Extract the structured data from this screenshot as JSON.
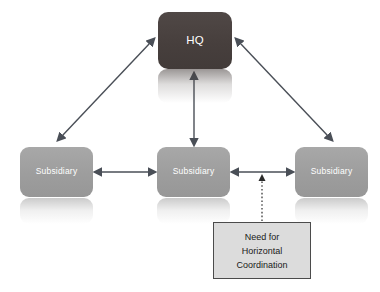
{
  "diagram": {
    "colors": {
      "hq_fill": "#473f3d",
      "subsidiary_fill": "#9d9d9d",
      "arrow": "#4a4f57",
      "callout_fill": "#dcdcdc",
      "callout_border": "#4b4b4b",
      "node_text": "#ffffff",
      "callout_text": "#1a1a1a",
      "background": "#ffffff"
    },
    "nodes": {
      "hq": {
        "label": "HQ"
      },
      "subsidiary_left": {
        "label": "Subsidiary"
      },
      "subsidiary_center": {
        "label": "Subsidiary"
      },
      "subsidiary_right": {
        "label": "Subsidiary"
      }
    },
    "callout": {
      "lines": [
        "Need for",
        "Horizontal",
        "Coordination"
      ],
      "line1": "Need for",
      "line2": "Horizontal",
      "line3": "Coordination"
    },
    "connectors": [
      {
        "name": "hq-to-subsidiary-left",
        "from": "hq",
        "to": "subsidiary_left",
        "style": "double-arrow-diagonal"
      },
      {
        "name": "hq-to-subsidiary-center",
        "from": "hq",
        "to": "subsidiary_center",
        "style": "double-arrow-vertical"
      },
      {
        "name": "hq-to-subsidiary-right",
        "from": "hq",
        "to": "subsidiary_right",
        "style": "double-arrow-diagonal"
      },
      {
        "name": "subsidiary-left-to-center",
        "from": "subsidiary_left",
        "to": "subsidiary_center",
        "style": "double-arrow-horizontal"
      },
      {
        "name": "subsidiary-center-to-right",
        "from": "subsidiary_center",
        "to": "subsidiary_right",
        "style": "double-arrow-horizontal"
      },
      {
        "name": "callout-to-horizontal-link",
        "from": "callout",
        "to": "subsidiary-center-to-right",
        "style": "dotted-arrow-up"
      }
    ]
  }
}
